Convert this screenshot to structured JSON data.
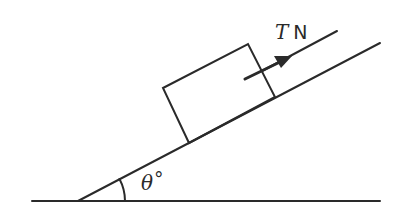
{
  "diagram": {
    "force_label": {
      "symbol": "T",
      "unit": "N"
    },
    "angle_label": {
      "symbol": "θ",
      "unit": "°"
    },
    "colors": {
      "line": "#2a2a2a",
      "background": "#ffffff"
    }
  }
}
